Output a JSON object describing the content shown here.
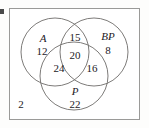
{
  "diagram": {
    "outline_color": "#9a9a98",
    "circle_color": "#6e6c6a",
    "text_color": "#23201e",
    "sets": [
      {
        "id": "A",
        "label": "A",
        "only_count": "12"
      },
      {
        "id": "BP",
        "label": "BP",
        "only_count": "8"
      },
      {
        "id": "P",
        "label": "P",
        "only_count": "22"
      }
    ],
    "intersections": [
      {
        "id": "A-BP",
        "count": "15"
      },
      {
        "id": "A-P",
        "count": "24"
      },
      {
        "id": "BP-P",
        "count": "16"
      },
      {
        "id": "A-BP-P",
        "count": "20"
      }
    ],
    "outside": {
      "id": "neither",
      "count": "2"
    }
  }
}
